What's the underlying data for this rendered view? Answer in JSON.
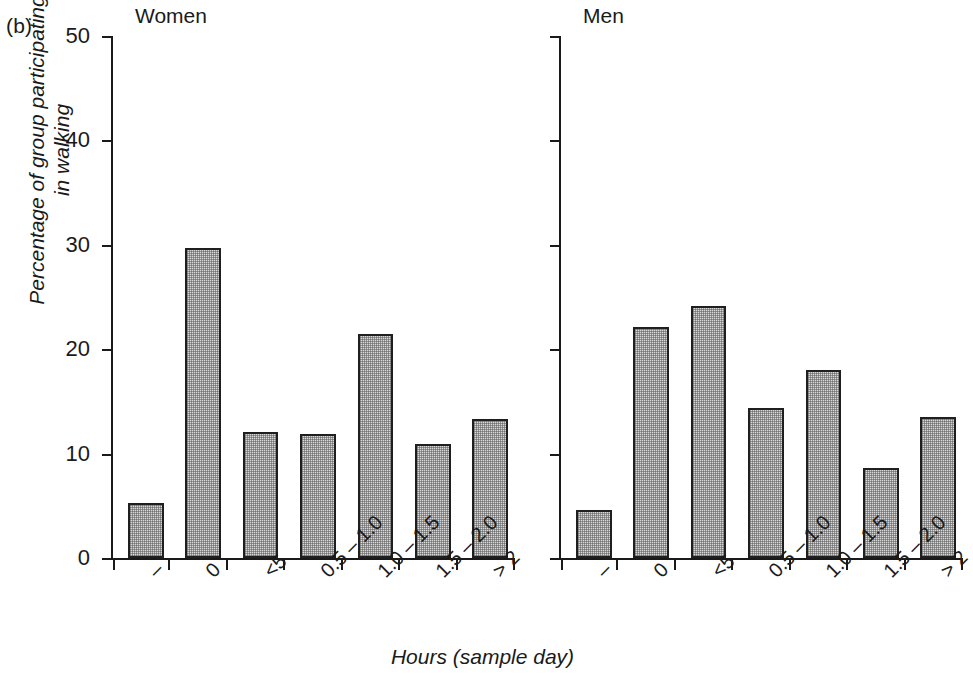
{
  "figure": {
    "panel_letter": "(b)",
    "xlabel": "Hours (sample day)",
    "ylabel_line1": "Percentage of group participating",
    "ylabel_line2": "in walking",
    "ylabel": "Percentage of group participating\nin walking",
    "bar_fill_color": "#d9d9d9",
    "bar_border_color": "#1f1f1f",
    "axis_color": "#1a1a1a"
  },
  "chart_data": {
    "type": "bar",
    "title": "",
    "subtitle": "",
    "xlabel": "Hours (sample day)",
    "ylabel": "Percentage of group participating in walking",
    "ylim": [
      0,
      50
    ],
    "yticks": [
      0,
      10,
      20,
      30,
      40,
      50
    ],
    "ytick_labels": [
      "0",
      "10",
      "20",
      "30",
      "40",
      "50"
    ],
    "grid": false,
    "legend": "none",
    "panels": [
      {
        "name": "Women",
        "categories": [
          "–",
          "0",
          "<5",
          "0.5 – 1.0",
          "1.0 – 1.5",
          "1.5 – 2.0",
          "> 2"
        ],
        "values": [
          5.3,
          29.7,
          12.1,
          11.9,
          21.5,
          10.9,
          13.3
        ]
      },
      {
        "name": "Men",
        "categories": [
          "–",
          "0",
          "<5",
          "0.5 – 1.0",
          "1.0 – 1.5",
          "1.5 – 2.0",
          "> 2"
        ],
        "values": [
          4.6,
          22.1,
          24.1,
          14.4,
          18.0,
          8.6,
          13.5
        ]
      }
    ]
  }
}
